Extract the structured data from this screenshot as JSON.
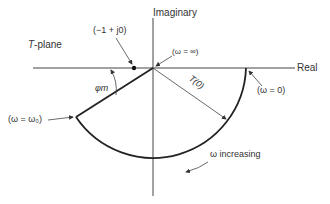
{
  "diagram": {
    "title": "T-plane",
    "title_italic_part": "T",
    "title_rest": "-plane",
    "axes": {
      "real_label": "Real",
      "imaginary_label": "Imaginary"
    },
    "annotations": {
      "critical_point": "(−1 + j0)",
      "omega_infinity": "(ω = ∞)",
      "omega_zero": "(ω = 0)",
      "omega_zero_pt": "(ω = ω₀)",
      "t0": "T(0)",
      "phase_margin": "φm",
      "omega_increasing": "ω increasing"
    },
    "colors": {
      "line": "#222222",
      "thin_line": "#555555",
      "text": "#333333"
    }
  }
}
